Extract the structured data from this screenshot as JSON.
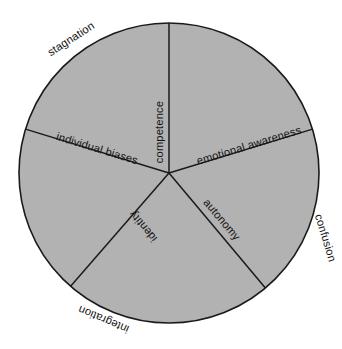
{
  "diagram": {
    "type": "circle-sector-wheel",
    "shape": "circle",
    "fill_color": "#b2b2b2",
    "stroke_color": "#1a1a1a",
    "background_color": "#ffffff",
    "center": {
      "x": 169,
      "y": 173
    },
    "radius": 150,
    "sector_count": 5,
    "inner_labels": [
      {
        "id": "competence",
        "text": "competence",
        "position": "upper-centre",
        "orientation": "vertical-bottom-to-top"
      },
      {
        "id": "emotional-awareness",
        "text": "emotional awareness",
        "position": "upper-right",
        "orientation": "rotated-up-right"
      },
      {
        "id": "individual-biases",
        "text": "individual biases",
        "position": "upper-left",
        "orientation": "rotated-down-right"
      },
      {
        "id": "autonomy",
        "text": "autonomy",
        "position": "lower-right",
        "orientation": "rotated-down-right"
      },
      {
        "id": "identity",
        "text": "identity",
        "position": "lower-left",
        "orientation": "rotated-inverted"
      }
    ],
    "outer_labels": [
      {
        "id": "stagnation",
        "text": "stagnation",
        "position": "outside-upper-left",
        "orientation": "rotated-up-right"
      },
      {
        "id": "confusion",
        "text": "confusion",
        "position": "outside-right",
        "orientation": "rotated-down"
      },
      {
        "id": "integration",
        "text": "integration",
        "position": "outside-bottom-left",
        "orientation": "rotated-inverted"
      }
    ],
    "spokes": [
      {
        "id": "spoke-up",
        "angle_deg": 90,
        "to_label": "competence"
      },
      {
        "id": "spoke-upper-right",
        "angle_deg": 17,
        "to_label": "emotional awareness"
      },
      {
        "id": "spoke-upper-left",
        "angle_deg": 163,
        "to_label": "individual biases"
      },
      {
        "id": "spoke-lower-left",
        "angle_deg": 229,
        "to_label": "integration"
      },
      {
        "id": "spoke-lower-right",
        "angle_deg": 310,
        "to_label": "autonomy"
      }
    ]
  }
}
